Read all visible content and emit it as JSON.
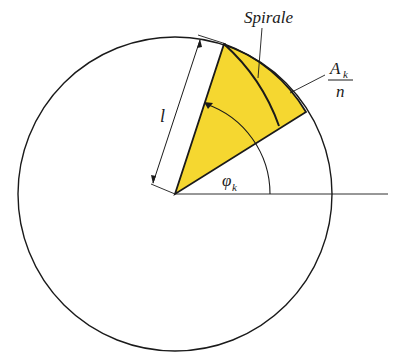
{
  "diagram": {
    "title": "",
    "labels": {
      "spiral": "Spirale",
      "length": "l",
      "angle": "φ",
      "angle_sub": "k",
      "area_num": "A",
      "area_num_sub": "k",
      "area_den": "n"
    },
    "colors": {
      "sector_fill": "#F5D730",
      "stroke": "#1a1a1a",
      "background": "#ffffff"
    },
    "geometry": {
      "center": [
        175,
        194
      ],
      "radius": 157
    }
  }
}
